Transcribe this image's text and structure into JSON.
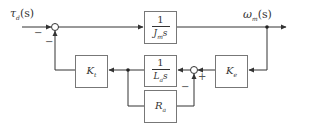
{
  "diagram": {
    "title": "",
    "colors": {
      "line": "#333333",
      "box_border": "#555555",
      "background": "#ffffff"
    },
    "signals": {
      "input": {
        "label": "τ",
        "sub": "d",
        "arg": "(s)"
      },
      "output": {
        "label": "ω",
        "sub": "m",
        "arg": "(s)"
      }
    },
    "blocks": [
      {
        "id": "Jm",
        "type": "fraction",
        "num": "1",
        "den_main": "J",
        "den_sub": "m",
        "den_tail": "s"
      },
      {
        "id": "La",
        "type": "fraction",
        "num": "1",
        "den_main": "L",
        "den_sub": "a",
        "den_tail": "s"
      },
      {
        "id": "Ra",
        "type": "gain",
        "main": "R",
        "sub": "a"
      },
      {
        "id": "Kt",
        "type": "gain",
        "main": "K",
        "sub": "t"
      },
      {
        "id": "Ke",
        "type": "gain",
        "main": "K",
        "sub": "e"
      }
    ],
    "summing_junctions": [
      {
        "id": "sum1",
        "signs": [
          "−",
          "−"
        ]
      },
      {
        "id": "sum2",
        "signs": [
          "+",
          "−"
        ]
      }
    ]
  }
}
